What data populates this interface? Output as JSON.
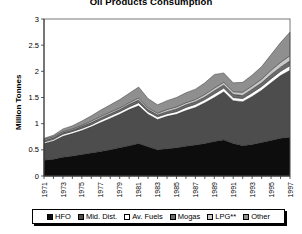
{
  "chart_data": {
    "type": "area",
    "title": "Oil Products Consumption",
    "xlabel": "",
    "ylabel": "Million Tonnes",
    "ylim": [
      0,
      3
    ],
    "yticks": [
      "0",
      "0.5",
      "1",
      "1.5",
      "2",
      "2.5",
      "3"
    ],
    "grid": false,
    "legend_position": "bottom",
    "stacked": true,
    "x": [
      1971,
      1972,
      1973,
      1974,
      1975,
      1976,
      1977,
      1978,
      1979,
      1980,
      1981,
      1982,
      1983,
      1984,
      1985,
      1986,
      1987,
      1988,
      1989,
      1990,
      1991,
      1992,
      1993,
      1994,
      1995,
      1996,
      1997
    ],
    "xtick_labels": [
      "1971",
      "1973",
      "1975",
      "1977",
      "1979",
      "1981",
      "1983",
      "1985",
      "1987",
      "1989",
      "1991",
      "1993",
      "1995",
      "1997"
    ],
    "series": [
      {
        "name": "HFO",
        "color": "#0d0d0d",
        "values": [
          0.3,
          0.32,
          0.36,
          0.38,
          0.41,
          0.44,
          0.47,
          0.5,
          0.54,
          0.58,
          0.62,
          0.56,
          0.5,
          0.52,
          0.54,
          0.57,
          0.59,
          0.62,
          0.66,
          0.69,
          0.62,
          0.58,
          0.6,
          0.64,
          0.68,
          0.72,
          0.74
        ]
      },
      {
        "name": "Mid. Dist.",
        "color": "#4d4d4d",
        "values": [
          0.32,
          0.35,
          0.4,
          0.43,
          0.46,
          0.5,
          0.55,
          0.6,
          0.64,
          0.69,
          0.72,
          0.62,
          0.58,
          0.62,
          0.64,
          0.68,
          0.72,
          0.78,
          0.84,
          0.92,
          0.82,
          0.84,
          0.92,
          1.0,
          1.1,
          1.2,
          1.28
        ]
      },
      {
        "name": "Av. Fuels",
        "color": "#ffffff",
        "values": [
          0.03,
          0.03,
          0.04,
          0.04,
          0.04,
          0.04,
          0.05,
          0.05,
          0.05,
          0.05,
          0.06,
          0.05,
          0.05,
          0.05,
          0.05,
          0.06,
          0.06,
          0.06,
          0.07,
          0.07,
          0.06,
          0.06,
          0.07,
          0.07,
          0.08,
          0.08,
          0.09
        ]
      },
      {
        "name": "Mogas",
        "color": "#6b6b6b",
        "values": [
          0.03,
          0.03,
          0.03,
          0.03,
          0.04,
          0.04,
          0.04,
          0.04,
          0.04,
          0.05,
          0.05,
          0.04,
          0.04,
          0.04,
          0.05,
          0.05,
          0.05,
          0.05,
          0.06,
          0.06,
          0.06,
          0.06,
          0.07,
          0.07,
          0.08,
          0.08,
          0.09
        ]
      },
      {
        "name": "LPG**",
        "color": "#c9c9c9",
        "values": [
          0.02,
          0.02,
          0.02,
          0.02,
          0.02,
          0.03,
          0.03,
          0.03,
          0.03,
          0.03,
          0.04,
          0.03,
          0.03,
          0.04,
          0.04,
          0.04,
          0.04,
          0.05,
          0.05,
          0.05,
          0.05,
          0.06,
          0.06,
          0.07,
          0.08,
          0.09,
          0.1
        ]
      },
      {
        "name": "Other",
        "color": "#8f8f8f",
        "values": [
          0.02,
          0.03,
          0.05,
          0.06,
          0.08,
          0.1,
          0.12,
          0.14,
          0.16,
          0.18,
          0.21,
          0.18,
          0.16,
          0.17,
          0.18,
          0.19,
          0.2,
          0.22,
          0.26,
          0.18,
          0.17,
          0.19,
          0.21,
          0.24,
          0.3,
          0.38,
          0.45
        ]
      }
    ],
    "totals": [
      0.72,
      0.78,
      0.9,
      0.96,
      1.05,
      1.15,
      1.26,
      1.36,
      1.46,
      1.58,
      1.7,
      1.48,
      1.36,
      1.44,
      1.5,
      1.59,
      1.66,
      1.78,
      1.94,
      1.97,
      1.78,
      1.79,
      1.93,
      2.09,
      2.32,
      2.55,
      2.75
    ]
  },
  "legend": {
    "items": [
      {
        "label": "HFO",
        "color": "#0d0d0d"
      },
      {
        "label": "Mid. Dist.",
        "color": "#4d4d4d"
      },
      {
        "label": "Av. Fuels",
        "color": "#ffffff"
      },
      {
        "label": "Mogas",
        "color": "#6b6b6b"
      },
      {
        "label": "LPG**",
        "color": "#c9c9c9"
      },
      {
        "label": "Other",
        "color": "#8f8f8f"
      }
    ]
  }
}
